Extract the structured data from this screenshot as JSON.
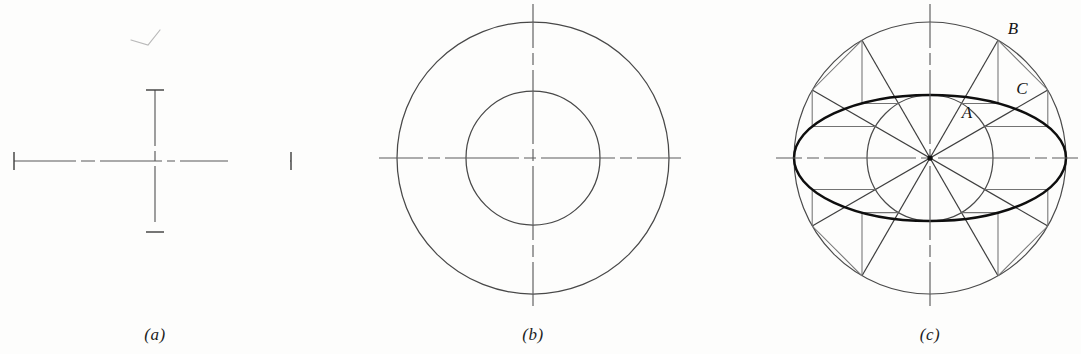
{
  "figure": {
    "background_color": "#fdfdfc",
    "line_color": "#3c3c3c",
    "construction_line_color": "#6e6e6e",
    "ellipse_color": "#101010",
    "center_line_color": "#585858",
    "width": 1081,
    "height": 354
  },
  "panels": [
    {
      "id": "a",
      "caption": "(a)",
      "caption_x": 155,
      "caption_y": 325,
      "description": "Center lines laid out: horizontal major axis line and vertical minor axis line crossing at the center, each terminated with short end ticks.",
      "center": {
        "x": 155,
        "y": 161
      },
      "horizontal_axis": {
        "x1": 14,
        "x2": 291,
        "y": 161,
        "tick_half_height": 9
      },
      "vertical_axis": {
        "y1": 90,
        "y2": 232,
        "x": 155,
        "tick_half_width": 9
      }
    },
    {
      "id": "b",
      "caption": "(b)",
      "caption_x": 533,
      "caption_y": 325,
      "description": "Two concentric circles drawn on the center lines: the larger circle has a diameter equal to the major axis, the smaller circle a diameter equal to the minor axis.",
      "center": {
        "x": 533,
        "y": 158
      },
      "outer_circle_radius": 136,
      "inner_circle_radius": 67,
      "center_line_overhang": 18
    },
    {
      "id": "c",
      "caption": "(c)",
      "caption_x": 930,
      "caption_y": 325,
      "description": "Radial lines are drawn every 30 degrees. From each intersection B on the outer circle a vertical line is drawn, and from each intersection A on the inner circle a horizontal line is drawn. Their meeting point C lies on the required ellipse.",
      "center": {
        "x": 930,
        "y": 158
      },
      "outer_circle_radius": 136,
      "inner_circle_radius": 63,
      "ellipse_semi_major": 136,
      "ellipse_semi_minor": 63,
      "radial_spacing_degrees": 30,
      "radial_angles_degrees": [
        0,
        30,
        60,
        90,
        120,
        150,
        180,
        210,
        240,
        270,
        300,
        330
      ],
      "center_line_overhang": 18,
      "point_labels": [
        {
          "text": "A",
          "x": 967,
          "y": 113,
          "meaning": "intersection of radial line with inner circle"
        },
        {
          "text": "B",
          "x": 1013,
          "y": 29,
          "meaning": "intersection of radial line with outer circle"
        },
        {
          "text": "C",
          "x": 1022,
          "y": 89,
          "meaning": "point on the required ellipse"
        }
      ]
    }
  ],
  "artifacts": [
    {
      "name": "pencil-check-mark",
      "description": "faint stray pencil check-mark above panel (a)",
      "x": 140,
      "y": 38
    }
  ]
}
